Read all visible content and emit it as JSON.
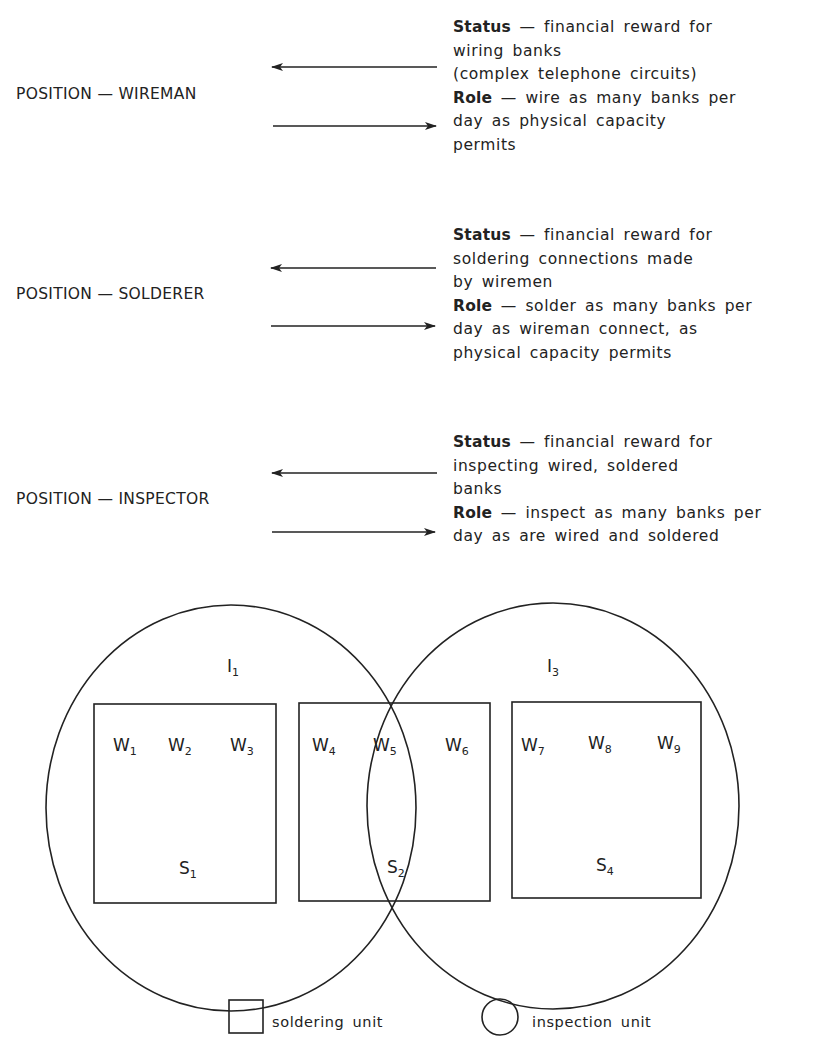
{
  "positions": [
    {
      "label": "POSITION — WIREMAN",
      "status_heading": "Status",
      "status_lines": [
        "— financial reward for",
        "wiring banks",
        "(complex telephone circuits)"
      ],
      "role_heading": "Role",
      "role_lines": [
        "— wire as many banks per",
        "day as physical capacity",
        "permits"
      ]
    },
    {
      "label": "POSITION — SOLDERER",
      "status_heading": "Status",
      "status_lines": [
        "— financial reward for",
        "soldering connections made",
        "by wiremen"
      ],
      "role_heading": "Role",
      "role_lines": [
        "— solder as many banks per",
        "day as wireman connect, as",
        "physical capacity permits"
      ]
    },
    {
      "label": "POSITION — INSPECTOR",
      "status_heading": "Status",
      "status_lines": [
        "— financial reward for",
        "inspecting wired, soldered",
        "banks"
      ],
      "role_heading": "Role",
      "role_lines": [
        "— inspect as many banks per",
        "day as are wired and soldered"
      ]
    }
  ],
  "diagram": {
    "inspection_units": [
      {
        "base": "I",
        "sub": "1"
      },
      {
        "base": "I",
        "sub": "3"
      }
    ],
    "soldering_units": [
      {
        "base": "S",
        "sub": "1",
        "wiremen": [
          {
            "base": "W",
            "sub": "1"
          },
          {
            "base": "W",
            "sub": "2"
          },
          {
            "base": "W",
            "sub": "3"
          }
        ]
      },
      {
        "base": "S",
        "sub": "2",
        "wiremen": [
          {
            "base": "W",
            "sub": "4"
          },
          {
            "base": "W",
            "sub": "5"
          },
          {
            "base": "W",
            "sub": "6"
          }
        ]
      },
      {
        "base": "S",
        "sub": "4",
        "wiremen": [
          {
            "base": "W",
            "sub": "7"
          },
          {
            "base": "W",
            "sub": "8"
          },
          {
            "base": "W",
            "sub": "9"
          }
        ]
      }
    ]
  },
  "legend": {
    "square_label": "soldering unit",
    "circle_label": "inspection unit"
  },
  "colors": {
    "ink": "#222222",
    "background": "#ffffff"
  }
}
